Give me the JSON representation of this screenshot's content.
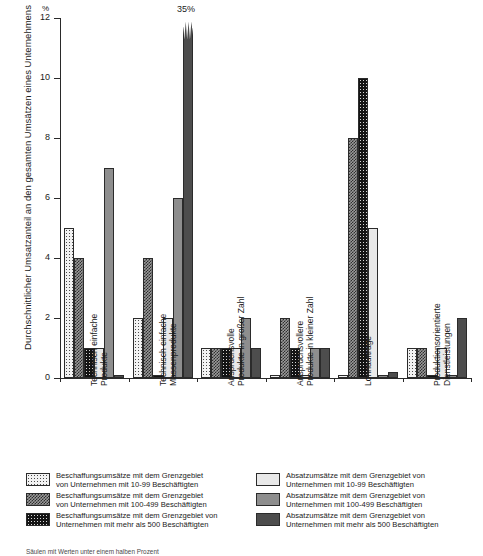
{
  "chart_data": {
    "type": "bar",
    "title": "",
    "xlabel": "",
    "ylabel": "Durchschnittlicher Umsatzanteil an den gesamten Umsätzen eines Unternehmens",
    "yunit": "%",
    "ylim": [
      0,
      12
    ],
    "yticks": [
      0,
      2,
      4,
      6,
      8,
      10,
      12
    ],
    "ytick_labels": [
      "0",
      "2",
      "4",
      "6",
      "8",
      "10",
      "12"
    ],
    "grid": false,
    "legend_position": "bottom",
    "categories": [
      "Technisch einfache Produkte",
      "Technisch einfache Massenprodukte",
      "Anspruchsvolle Produkte in großer Zahl",
      "Anspruchsvollere Produkte in kleiner Zahl",
      "Lohnaufträge",
      "Produktionsorientierte Dienstleistungen"
    ],
    "category_lines": [
      [
        "Technisch einfache",
        "Produkte"
      ],
      [
        "Technisch einfache",
        "Massenprodukte"
      ],
      [
        "Anspruchsvolle",
        "Produkte in großer Zahl"
      ],
      [
        "Anspruchsvollere",
        "Produkte in kleiner Zahl"
      ],
      [
        "Lohnaufträge",
        ""
      ],
      [
        "Produktionsorientierte",
        "Dienstleistungen"
      ]
    ],
    "series": [
      {
        "name": "Beschaffungsumsätze mit dem Grenzgebiet von Unternehmen mit 10-99 Beschäftigten",
        "pattern": "p-dots-light",
        "values": [
          5,
          2,
          1,
          0.1,
          0.1,
          1
        ]
      },
      {
        "name": "Beschaffungsumsätze mit dem Grenzgebiet von Unternehmen mit 100-499 Beschäftigten",
        "pattern": "p-check-dark",
        "values": [
          4,
          4,
          1,
          2,
          8,
          1
        ]
      },
      {
        "name": "Beschaffungsumsätze mit dem Grenzgebiet von Unternehmen mit mehr als 500 Beschäftigten",
        "pattern": "p-dots-black",
        "values": [
          1,
          0.1,
          1,
          1,
          10,
          0.1
        ]
      },
      {
        "name": "Absatzumsätze mit dem Grenzgebiet von Unternehmen mit 10-99 Beschäftigten",
        "pattern": "p-solid-light",
        "values": [
          1,
          2,
          1,
          0.1,
          5,
          1
        ]
      },
      {
        "name": "Absatzumsätze mit dem Grenzgebiet von Unternehmen mit 100-499 Beschäftigten",
        "pattern": "p-solid-mid",
        "values": [
          7,
          6,
          2,
          1,
          0.1,
          0.1
        ]
      },
      {
        "name": "Absatzumsätze mit dem Grenzgebiet von Unternehmen mit mehr als 500 Beschäftigten",
        "pattern": "p-solid-dark",
        "values": [
          0.1,
          35,
          1,
          1,
          0.2,
          2
        ]
      }
    ],
    "annotations": [
      {
        "text": "35%",
        "category_index": 1,
        "series_index": 5,
        "note": "Bar exceeds axis maximum; drawn clipped with jagged top"
      }
    ]
  },
  "legend": {
    "left_column": [
      {
        "pattern": "p-dots-light",
        "line1": "Beschaffungsumsätze mit dem Grenzgebiet",
        "line2": "von Unternehmen mit 10-99 Beschäftigten"
      },
      {
        "pattern": "p-check-dark",
        "line1": "Beschaffungsumsätze mit dem Grenzgebiet",
        "line2": "von Unternehmen mit 100-499 Beschäftigten"
      },
      {
        "pattern": "p-dots-black",
        "line1": "Beschaffungsumsätze mit dem Grenzgebiet von",
        "line2": "Unternehmen mit mehr als 500 Beschäftigten"
      }
    ],
    "right_column": [
      {
        "pattern": "p-solid-light",
        "line1": "Absatzumsätze mit dem Grenzgebiet von",
        "line2": "Unternehmen mit 10-99 Beschäftigten"
      },
      {
        "pattern": "p-solid-mid",
        "line1": "Absatzumsätze mit dem Grenzgebiet von",
        "line2": "Unternehmen mit 100-499 Beschäftigten"
      },
      {
        "pattern": "p-solid-dark",
        "line1": "Absatzumsätze mit dem Grenzgebiet von",
        "line2": "Unternehmen mit mehr als 500 Beschäftigten"
      }
    ]
  },
  "footnote": {
    "text": "Säulen mit Werten unter einem halben Prozent"
  },
  "colors": {
    "axis": "#2a2a2a",
    "text": "#1a1a1a",
    "light": "#e9e9e9",
    "mid": "#8e8e8e",
    "dark": "#4d4d4d"
  }
}
